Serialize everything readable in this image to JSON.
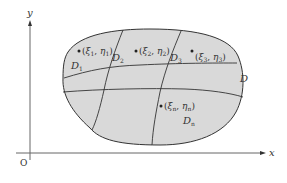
{
  "diagram": {
    "axes": {
      "x_label": "x",
      "y_label": "y",
      "origin_label": "O"
    },
    "region_label": "D",
    "subregions": [
      {
        "label": "D",
        "sub": "1"
      },
      {
        "label": "D",
        "sub": "2"
      },
      {
        "label": "D",
        "sub": "3"
      },
      {
        "label": "D",
        "sub": "n"
      }
    ],
    "points": [
      {
        "xi": "ξ",
        "xi_sub": "1",
        "eta": "η",
        "eta_sub": "1"
      },
      {
        "xi": "ξ",
        "xi_sub": "2",
        "eta": "η",
        "eta_sub": "2"
      },
      {
        "xi": "ξ",
        "xi_sub": "3",
        "eta": "η",
        "eta_sub": "3"
      },
      {
        "xi": "ξ",
        "xi_sub": "n",
        "eta": "η",
        "eta_sub": "n"
      }
    ],
    "colors": {
      "region_fill": "#d9d9d9",
      "stroke": "#333333",
      "axis": "#555555"
    }
  }
}
